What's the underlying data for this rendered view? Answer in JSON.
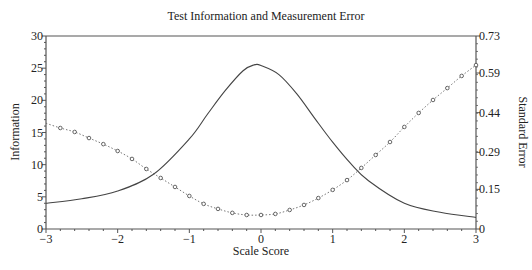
{
  "chart_data": {
    "type": "line",
    "title": "Test Information and Measurement Error",
    "xlabel": "Scale Score",
    "ylabel": "Information",
    "ylabel_right": "Standard Error",
    "xlim": [
      -3,
      3
    ],
    "ylim": [
      0,
      30
    ],
    "ylim_right": [
      0,
      0.73
    ],
    "x_ticks": [
      "−3",
      "−2",
      "−1",
      "0",
      "1",
      "2",
      "3"
    ],
    "y_ticks": [
      "0",
      "5",
      "10",
      "15",
      "20",
      "25",
      "30"
    ],
    "y_ticks_right": [
      "0",
      "0.15",
      "0.29",
      "0.44",
      "0.59",
      "0.73"
    ],
    "grid": false,
    "legend": null,
    "series": [
      {
        "name": "Information",
        "axis": "left",
        "style": "solid",
        "x": [
          -3,
          -2.5,
          -2,
          -1.5,
          -1,
          -0.75,
          -0.5,
          -0.25,
          -0.1,
          0,
          0.25,
          0.5,
          0.75,
          1,
          1.25,
          1.5,
          2,
          2.5,
          3
        ],
        "values": [
          4.0,
          4.7,
          5.9,
          8.5,
          14.0,
          17.8,
          21.5,
          24.6,
          25.5,
          25.4,
          24.0,
          21.0,
          17.2,
          13.5,
          10.2,
          7.5,
          4.0,
          2.6,
          1.8
        ]
      },
      {
        "name": "Standard Error",
        "axis": "right",
        "style": "dotted-markers",
        "x": [
          -3,
          -2.8,
          -2.6,
          -2.4,
          -2.2,
          -2.0,
          -1.8,
          -1.6,
          -1.4,
          -1.2,
          -1.0,
          -0.8,
          -0.6,
          -0.4,
          -0.2,
          0,
          0.2,
          0.4,
          0.6,
          0.8,
          1.0,
          1.2,
          1.4,
          1.6,
          1.8,
          2.0,
          2.2,
          2.4,
          2.6,
          2.8,
          3.0
        ],
        "values": [
          0.4,
          0.382,
          0.367,
          0.344,
          0.321,
          0.295,
          0.265,
          0.227,
          0.193,
          0.159,
          0.125,
          0.095,
          0.076,
          0.061,
          0.053,
          0.053,
          0.057,
          0.072,
          0.091,
          0.117,
          0.148,
          0.185,
          0.231,
          0.28,
          0.329,
          0.386,
          0.439,
          0.488,
          0.533,
          0.579,
          0.62
        ],
        "marker_x_start": -2.8
      }
    ]
  }
}
